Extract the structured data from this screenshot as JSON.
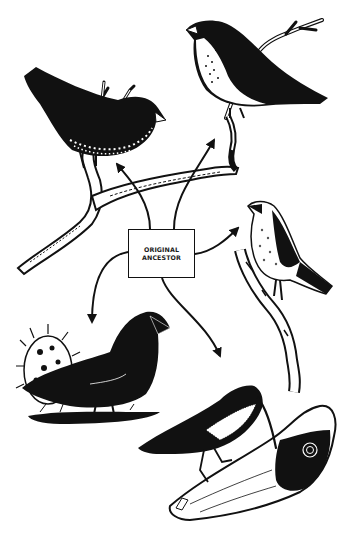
{
  "diagram": {
    "type": "adaptive-radiation-illustration",
    "center_node": {
      "line1": "ORIGINAL",
      "line2": "ANCESTOR"
    },
    "branches": [
      {
        "name": "bird-top-left",
        "description": "dark finch with speckled belly on branch"
      },
      {
        "name": "bird-top-right",
        "description": "finch with spotted pale breast on twig"
      },
      {
        "name": "bird-right",
        "description": "small warbler-like bird on upright branch"
      },
      {
        "name": "bird-bottom-left",
        "description": "black ground finch beside cactus"
      },
      {
        "name": "bird-bottom-right",
        "description": "long-billed bird probing a log"
      }
    ],
    "colors": {
      "ink": "#111111",
      "paper": "#ffffff"
    }
  }
}
